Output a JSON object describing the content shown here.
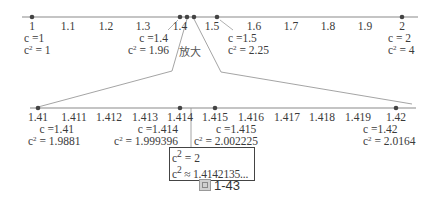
{
  "top_line": {
    "ticks": [
      "1",
      "1.1",
      "1.2",
      "1.3",
      "1.4",
      "1.5",
      "1.6",
      "1.7",
      "1.8",
      "1.9",
      "2"
    ],
    "points": [
      {
        "c_label": "c =1",
        "c2_label": "= 1"
      },
      {
        "c_label": "c =1.4",
        "c2_label": "= 1.96"
      },
      {
        "c_label": "c =1.5",
        "c2_label": "= 2.25"
      },
      {
        "c_label": "c = 2",
        "c2_label": "= 4"
      }
    ]
  },
  "zoom_label": "放大",
  "bottom_line": {
    "ticks": [
      "1.41",
      "1.411",
      "1.412",
      "1.413",
      "1.414",
      "1.415",
      "1.416",
      "1.417",
      "1.418",
      "1.419",
      "1.42"
    ],
    "points": [
      {
        "c_label": "c =1.41",
        "c2_label": "= 1.9881"
      },
      {
        "c_label": "c =1.414",
        "c2_label": "= 1.999396"
      },
      {
        "c_label": "c =1.415",
        "c2_label": "= 2.002225"
      },
      {
        "c_label": "c =1.42",
        "c2_label": "= 2.0164"
      }
    ]
  },
  "result_box": {
    "line1": "= 2",
    "line2": "≈ 1.4142135..."
  },
  "caption": {
    "prefix": "圖",
    "number": "1-43"
  },
  "c_symbol": "c",
  "sup_2": "2",
  "colors": {
    "line": "#8a8a8a",
    "dot": "#444444",
    "text": "#3a3a3a"
  }
}
